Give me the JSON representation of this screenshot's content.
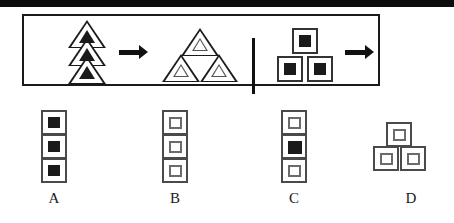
{
  "page": {
    "type": "visual-analogy-question",
    "top_bar_color": "#0d0d0d",
    "background_color": "#ffffff",
    "stroke_color": "#1a1a1a"
  },
  "stem": {
    "left_panel": {
      "source": {
        "arrangement": "vertical-stack",
        "shape": "triangle",
        "count": 3,
        "inner_fill": "filled",
        "items": [
          {
            "shape": "triangle",
            "inner": "filled"
          },
          {
            "shape": "triangle",
            "inner": "filled"
          },
          {
            "shape": "triangle",
            "inner": "filled"
          }
        ]
      },
      "operator": "arrow-right",
      "target": {
        "arrangement": "pyramid",
        "shape": "triangle",
        "count": 3,
        "inner_fill": "hollow",
        "items": [
          {
            "shape": "triangle",
            "inner": "hollow"
          },
          {
            "shape": "triangle",
            "inner": "hollow"
          },
          {
            "shape": "triangle",
            "inner": "hollow"
          }
        ]
      }
    },
    "divider": "vertical-rule",
    "right_panel": {
      "source": {
        "arrangement": "pyramid",
        "shape": "square",
        "count": 3,
        "inner_fill": "filled",
        "items": [
          {
            "shape": "square",
            "inner": "filled"
          },
          {
            "shape": "square",
            "inner": "filled"
          },
          {
            "shape": "square",
            "inner": "filled"
          }
        ]
      },
      "operator": "arrow-right",
      "target": {
        "arrangement": "unknown",
        "shape": "square",
        "count": 3,
        "inner_fill": "unknown"
      }
    }
  },
  "options": [
    {
      "label": "A",
      "arrangement": "vertical-stack",
      "shape": "square",
      "count": 3,
      "items": [
        {
          "inner": "filled"
        },
        {
          "inner": "filled"
        },
        {
          "inner": "filled"
        }
      ]
    },
    {
      "label": "B",
      "arrangement": "vertical-stack",
      "shape": "square",
      "count": 3,
      "items": [
        {
          "inner": "hollow"
        },
        {
          "inner": "hollow"
        },
        {
          "inner": "hollow"
        }
      ]
    },
    {
      "label": "C",
      "arrangement": "vertical-stack",
      "shape": "square",
      "count": 3,
      "items": [
        {
          "inner": "hollow"
        },
        {
          "inner": "filled"
        },
        {
          "inner": "hollow"
        }
      ]
    },
    {
      "label": "D",
      "arrangement": "pyramid",
      "shape": "square",
      "count": 3,
      "items": [
        {
          "inner": "hollow"
        },
        {
          "inner": "hollow"
        },
        {
          "inner": "hollow"
        }
      ]
    }
  ]
}
